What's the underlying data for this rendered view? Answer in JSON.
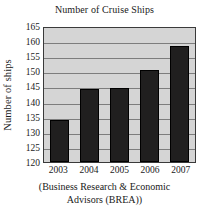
{
  "chart_data": {
    "type": "bar",
    "title": "Number of Cruise Ships",
    "xlabel": "",
    "ylabel": "Number of ships",
    "categories": [
      "2003",
      "2004",
      "2005",
      "2006",
      "2007"
    ],
    "values": [
      134,
      144,
      144.5,
      150.5,
      158.5
    ],
    "ylim": [
      120,
      165
    ],
    "ytick_values": [
      165,
      160,
      155,
      150,
      145,
      140,
      135,
      130,
      125,
      120
    ],
    "ytick_labels": [
      "165",
      "160",
      "155",
      "150",
      "145",
      "140",
      "135",
      "130",
      "125",
      "120"
    ],
    "grid": true,
    "legend": null,
    "series": [
      {
        "name": "Number of ships",
        "values": [
          134,
          144,
          144.5,
          150.5,
          158.5
        ]
      }
    ],
    "bar_color": "#201f1f",
    "plot_background": "#d5d5d5",
    "gridline_color": "#7d7d7d",
    "axis_color": "#3a3a3a"
  },
  "caption": {
    "line1": "(Business Research & Economic",
    "line2": "Advisors (BREA))"
  }
}
